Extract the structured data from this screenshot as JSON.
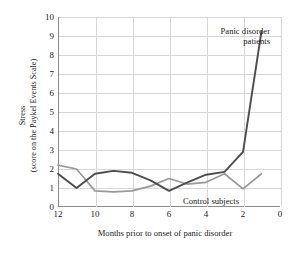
{
  "chart_data": {
    "type": "line",
    "title": "",
    "xlabel": "Months prior to onset of panic disorder",
    "ylabel_line1": "Stress",
    "ylabel_line2": "(score on the Paykel Events Scale)",
    "x": [
      12,
      11,
      10,
      9,
      8,
      7,
      6,
      5,
      4,
      3,
      2,
      1
    ],
    "xlim": [
      12,
      0
    ],
    "ylim": [
      0,
      10
    ],
    "xticks": [
      "12",
      "10",
      "8",
      "6",
      "4",
      "2",
      "0"
    ],
    "xtick_values": [
      12,
      10,
      8,
      6,
      4,
      2,
      0
    ],
    "yticks": [
      "0",
      "1",
      "2",
      "3",
      "4",
      "5",
      "6",
      "7",
      "8",
      "9",
      "10"
    ],
    "ytick_values": [
      0,
      1,
      2,
      3,
      4,
      5,
      6,
      7,
      8,
      9,
      10
    ],
    "grid": true,
    "legend_position": "inline-annotation",
    "series": [
      {
        "name": "Panic disorder patients",
        "color": "#4d4d4d",
        "x": [
          12,
          11,
          10,
          9,
          8,
          7,
          6,
          5,
          4,
          3,
          2,
          1
        ],
        "values": [
          1.75,
          1.0,
          1.75,
          1.9,
          1.8,
          1.4,
          0.85,
          1.3,
          1.7,
          1.85,
          2.9,
          9.25
        ],
        "annotation": "Panic disorder\npatients",
        "annotation_line1": "Panic disorder",
        "annotation_line2": "patients"
      },
      {
        "name": "Control subjects",
        "color": "#999999",
        "x": [
          12,
          11,
          10,
          9,
          8,
          7,
          6,
          5,
          4,
          3,
          2,
          1
        ],
        "values": [
          2.2,
          2.0,
          0.85,
          0.8,
          0.85,
          1.1,
          1.5,
          1.2,
          1.3,
          1.75,
          0.95,
          1.75
        ],
        "annotation": "Control subjects"
      }
    ]
  },
  "axes": {
    "x_title": "Months prior to onset of panic disorder",
    "y_title_line1": "Stress",
    "y_title_line2": "(score on the Paykel Events Scale)"
  },
  "colors": {
    "panic_line": "#4d4d4d",
    "control_line": "#999999",
    "gridline": "#d7d7d7",
    "axis": "#8a8a8a",
    "text": "#1a1a1a",
    "background": "#ffffff"
  }
}
